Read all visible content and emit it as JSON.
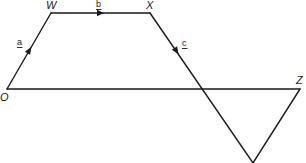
{
  "diagram": {
    "type": "vector-geometry",
    "points": {
      "O": {
        "label": "O",
        "x": 7,
        "y": 89
      },
      "W": {
        "label": "W",
        "x": 51,
        "y": 13
      },
      "X": {
        "label": "X",
        "x": 150,
        "y": 13
      },
      "Z": {
        "label": "Z",
        "x": 300,
        "y": 89
      },
      "Y": {
        "label": "",
        "x": 253,
        "y": 163
      }
    },
    "vectors": [
      {
        "from": "O",
        "to": "W",
        "label": "a"
      },
      {
        "from": "W",
        "to": "X",
        "label": "b"
      },
      {
        "from": "X",
        "to": "Y",
        "label": "c"
      }
    ],
    "segments": [
      {
        "from": "O",
        "to": "Z"
      },
      {
        "from": "Z",
        "to": "Y"
      }
    ],
    "colors": {
      "stroke": "#1a1a1a",
      "background": "#ffffff"
    }
  }
}
